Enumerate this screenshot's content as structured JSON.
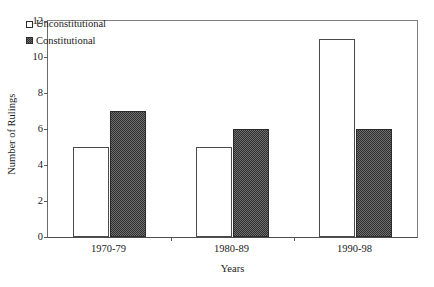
{
  "chart_data": {
    "type": "bar",
    "title": "",
    "subtitle": "",
    "xlabel": "Years",
    "ylabel": "Number of Rulings",
    "categories": [
      "1970-79",
      "1980-89",
      "1990-98"
    ],
    "series": [
      {
        "name": "Unconstitutional",
        "values": [
          5,
          5,
          11
        ],
        "style": "open"
      },
      {
        "name": "Constitutional",
        "values": [
          7,
          6,
          6
        ],
        "style": "filled"
      }
    ],
    "ylim": [
      0,
      12
    ],
    "yticks": [
      0,
      2,
      4,
      6,
      8,
      10,
      12
    ],
    "ytick_labels": [
      "0",
      "2",
      "4",
      "6",
      "8",
      "10",
      "12"
    ],
    "grid": false,
    "legend_position": "inside-top-left",
    "frame": true,
    "colors": {
      "unconstitutional_fill": "#ffffff",
      "unconstitutional_edge": "#4a4a4a",
      "constitutional_fill": "#555555",
      "constitutional_edge": "#2b2b2b",
      "axis": "#5a5a5a",
      "text": "#1a1a1a",
      "background": "#ffffff"
    }
  }
}
